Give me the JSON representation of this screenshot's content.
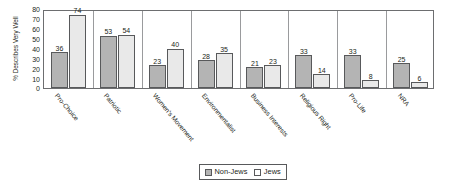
{
  "chart_data": {
    "type": "bar",
    "title": "",
    "xlabel": "",
    "ylabel": "% Describes Very Well",
    "ylim": [
      0,
      80
    ],
    "ytick_step": 10,
    "yticks": [
      80,
      70,
      60,
      50,
      40,
      30,
      20,
      10,
      0
    ],
    "grid": false,
    "legend_position": "bottom-center",
    "categories": [
      "Pro-Choice",
      "Patriotic",
      "Women's Movement",
      "Environmentalist",
      "Business Interests",
      "Religious Right",
      "Pro-Life",
      "NRA"
    ],
    "series": [
      {
        "name": "Non-Jews",
        "color": "#b4b4b4",
        "values": [
          36,
          53,
          23,
          28,
          21,
          33,
          33,
          25
        ]
      },
      {
        "name": "Jews",
        "color": "#e9e9e9",
        "values": [
          74,
          54,
          40,
          35,
          23,
          14,
          8,
          6
        ]
      }
    ]
  },
  "legend": {
    "items": [
      {
        "label": "Non-Jews"
      },
      {
        "label": "Jews"
      }
    ]
  },
  "colors": {
    "non_jews_fill": "#b4b4b4",
    "jews_fill": "#e9e9e9",
    "bar_border": "#58595b",
    "frame": "#6d6e70",
    "text": "#231f20",
    "background": "#ffffff"
  }
}
